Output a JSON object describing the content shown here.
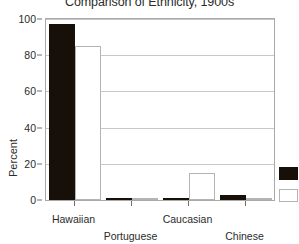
{
  "chart_data": {
    "type": "bar",
    "title": "Comparison of Ethnicity, 1900s",
    "xlabel": "",
    "ylabel": "Percent",
    "categories": [
      "Hawaiian",
      "Portuguese",
      "Caucasian",
      "Chinese"
    ],
    "series": [
      {
        "name": "Series 1",
        "color": "#171009",
        "values": [
          97,
          0.8,
          0.5,
          2.5
        ]
      },
      {
        "name": "Series 2",
        "color": "#ffffff",
        "values": [
          85,
          1.2,
          15,
          0.8
        ]
      }
    ],
    "ylim": [
      0,
      100
    ],
    "yticks": [
      0,
      20,
      40,
      60,
      80,
      100
    ],
    "ytick_labels": [
      "0",
      "20",
      "40",
      "60",
      "80",
      "100"
    ],
    "grid": true,
    "grid_axis": "y",
    "legend_position": "right",
    "legend_labels_visible": false
  },
  "axis": {
    "y_title": "Percent"
  }
}
